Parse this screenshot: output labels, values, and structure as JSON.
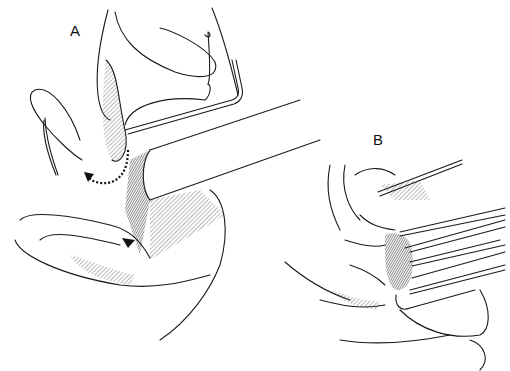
{
  "figure": {
    "panels": [
      {
        "id": "A",
        "label": "A",
        "description": "Sagittal line drawing with instrument inserted, dotted arrow showing direction"
      },
      {
        "id": "B",
        "label": "B",
        "description": "Sagittal line drawing with multiple retractor instruments"
      }
    ],
    "style": {
      "stroke_color": "#1a1a1a",
      "background": "#ffffff"
    }
  }
}
